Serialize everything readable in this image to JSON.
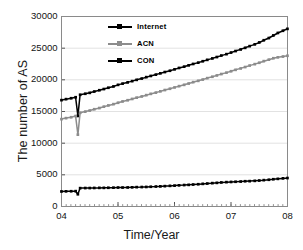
{
  "chart_data": {
    "type": "line",
    "title": "",
    "xlabel": "Time/Year",
    "ylabel": "The number of AS",
    "xlim": [
      2004.0,
      2008.0
    ],
    "ylim": [
      0,
      30000
    ],
    "grid": true,
    "legend_position": "top-left-inside",
    "xticklabels": [
      "04",
      "05",
      "06",
      "07",
      "08"
    ],
    "xtickvalues": [
      2004,
      2005,
      2006,
      2007,
      2008
    ],
    "yticklabels": [
      "0",
      "5000",
      "10000",
      "15000",
      "20000",
      "25000",
      "30000"
    ],
    "ytickvalues": [
      0,
      5000,
      10000,
      15000,
      20000,
      25000,
      30000
    ],
    "x": [
      2004.0,
      2004.08,
      2004.17,
      2004.25,
      2004.29,
      2004.33,
      2004.42,
      2004.5,
      2004.58,
      2004.67,
      2004.75,
      2004.83,
      2004.92,
      2005.0,
      2005.08,
      2005.17,
      2005.25,
      2005.33,
      2005.42,
      2005.5,
      2005.58,
      2005.67,
      2005.75,
      2005.83,
      2005.92,
      2006.0,
      2006.08,
      2006.17,
      2006.25,
      2006.33,
      2006.42,
      2006.5,
      2006.58,
      2006.67,
      2006.75,
      2006.83,
      2006.92,
      2007.0,
      2007.08,
      2007.17,
      2007.25,
      2007.33,
      2007.42,
      2007.5,
      2007.58,
      2007.67,
      2007.75,
      2007.83,
      2007.92,
      2008.0
    ],
    "series": [
      {
        "name": "Internet",
        "color": "#000000",
        "marker": "square",
        "values": [
          16800,
          16950,
          17100,
          17250,
          14300,
          17650,
          17800,
          17950,
          18150,
          18350,
          18550,
          18750,
          18950,
          19200,
          19400,
          19600,
          19800,
          20000,
          20200,
          20420,
          20620,
          20820,
          21020,
          21230,
          21440,
          21650,
          21870,
          22080,
          22290,
          22500,
          22720,
          22930,
          23150,
          23380,
          23600,
          23830,
          24060,
          24300,
          24550,
          24800,
          25050,
          25320,
          25600,
          25900,
          26250,
          26600,
          27000,
          27400,
          27750,
          28050
        ]
      },
      {
        "name": "ACN",
        "color": "#8c8c8c",
        "marker": "square",
        "values": [
          13800,
          13950,
          14100,
          14280,
          11350,
          14800,
          14980,
          15150,
          15350,
          15550,
          15760,
          15960,
          16160,
          16380,
          16580,
          16780,
          16980,
          17180,
          17380,
          17580,
          17780,
          17980,
          18180,
          18390,
          18600,
          18800,
          19000,
          19210,
          19420,
          19630,
          19840,
          20050,
          20270,
          20480,
          20700,
          20920,
          21140,
          21360,
          21580,
          21800,
          22020,
          22250,
          22480,
          22700,
          22950,
          23180,
          23400,
          23550,
          23680,
          23800
        ]
      },
      {
        "name": "CON",
        "color": "#000000",
        "marker": "square",
        "values": [
          2380,
          2400,
          2410,
          2420,
          1930,
          2900,
          2910,
          2920,
          2930,
          2940,
          2950,
          2960,
          2970,
          2990,
          3000,
          3010,
          3030,
          3050,
          3070,
          3090,
          3120,
          3150,
          3180,
          3220,
          3260,
          3300,
          3340,
          3380,
          3420,
          3470,
          3520,
          3570,
          3620,
          3680,
          3740,
          3790,
          3840,
          3880,
          3910,
          3940,
          3980,
          4010,
          4050,
          4100,
          4160,
          4230,
          4300,
          4370,
          4440,
          4500
        ]
      }
    ]
  },
  "legend": {
    "items": [
      {
        "label": "Internet",
        "color": "#000000"
      },
      {
        "label": "ACN",
        "color": "#8c8c8c"
      },
      {
        "label": "CON",
        "color": "#000000"
      }
    ]
  }
}
